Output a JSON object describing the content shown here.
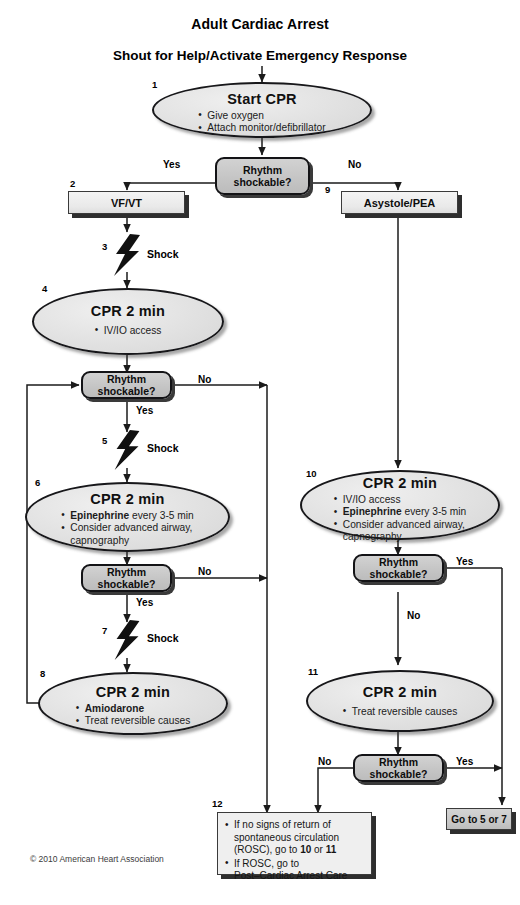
{
  "header": {
    "title": "Adult Cardiac Arrest",
    "subtitle": "Shout for Help/Activate Emergency Response"
  },
  "footer": {
    "copyright": "© 2010 American Heart Association"
  },
  "edge_labels": {
    "yes": "Yes",
    "no": "No",
    "shock": "Shock"
  },
  "nodes": {
    "n1": {
      "number": "1",
      "title": "Start CPR",
      "bullets": [
        "Give oxygen",
        "Attach monitor/defibrillator"
      ]
    },
    "d1": {
      "line1": "Rhythm",
      "line2": "shockable?"
    },
    "n2": {
      "number": "2",
      "label": "VF/VT"
    },
    "n3": {
      "number": "3",
      "label": "Shock"
    },
    "n4": {
      "number": "4",
      "title": "CPR 2 min",
      "bullets": [
        "IV/IO access"
      ]
    },
    "d2": {
      "line1": "Rhythm",
      "line2": "shockable?"
    },
    "n5": {
      "number": "5",
      "label": "Shock"
    },
    "n6": {
      "number": "6",
      "title": "CPR 2 min",
      "b1_bold": "Epinephrine",
      "b1_rest": " every 3-5 min",
      "b2": "Consider advanced airway,",
      "b2_cont": "capnography"
    },
    "d3": {
      "line1": "Rhythm",
      "line2": "shockable?"
    },
    "n7": {
      "number": "7",
      "label": "Shock"
    },
    "n8": {
      "number": "8",
      "title": "CPR 2 min",
      "b1_bold": "Amiodarone",
      "b2": "Treat reversible causes"
    },
    "n9": {
      "number": "9",
      "label": "Asystole/PEA"
    },
    "n10": {
      "number": "10",
      "title": "CPR 2 min",
      "b1": "IV/IO access",
      "b2_bold": "Epinephrine",
      "b2_rest": " every 3-5 min",
      "b3": "Consider advanced airway,",
      "b3_cont": "capnography"
    },
    "d4": {
      "line1": "Rhythm",
      "line2": "shockable?"
    },
    "n11": {
      "number": "11",
      "title": "CPR 2 min",
      "bullets": [
        "Treat reversible causes"
      ]
    },
    "d5": {
      "line1": "Rhythm",
      "line2": "shockable?"
    },
    "n12": {
      "number": "12",
      "b1_a": "If no signs of return of",
      "b1_b": "spontaneous circulation",
      "b1_c_pre": "(ROSC), go to ",
      "b1_c_bold1": "10",
      "b1_c_mid": " or ",
      "b1_c_bold2": "11",
      "b2_a": "If ROSC, go to",
      "b2_b": "Post–Cardiac Arrest Care"
    },
    "n13": {
      "label": "Go to 5 or 7"
    }
  },
  "colors": {
    "ellipse_fill": "#e3e3e3",
    "decision_fill": "#c4c4c4",
    "rect_fill": "#ebebeb",
    "stroke": "#17171a",
    "bolt": "#111111",
    "background": "#ffffff"
  }
}
